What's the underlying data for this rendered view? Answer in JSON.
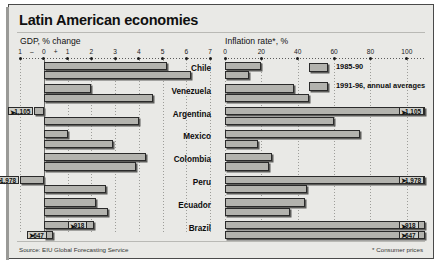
{
  "title": "Latin American economies",
  "source": "Source: EIU Global Forecasting Service",
  "footnote": "* Consumer prices",
  "legend": [
    {
      "label": "1985-90"
    },
    {
      "label": "1991-96, annual averages"
    }
  ],
  "panels": {
    "gdp": {
      "axis_title": "GDP, % change",
      "ticks": [
        "1",
        "–",
        "0",
        "+",
        "1",
        "2",
        "3",
        "4",
        "5",
        "6",
        "7"
      ]
    },
    "inflation": {
      "axis_title": "Inflation rate*, %",
      "ticks": [
        "0",
        "20",
        "40",
        "60",
        "80",
        "100"
      ]
    }
  },
  "chart_data": {
    "type": "bar",
    "title": "Latin American economies",
    "orientation": "horizontal",
    "categories": [
      "Chile",
      "Venezuela",
      "Argentina",
      "Mexico",
      "Colombia",
      "Peru",
      "Ecuador",
      "Brazil"
    ],
    "series_names": [
      "1985-90",
      "1991-96, annual averages"
    ],
    "panels": [
      {
        "name": "gdp",
        "xlabel": "GDP, % change",
        "xlim": [
          -1,
          7
        ],
        "ticks": [
          -1,
          0,
          1,
          2,
          3,
          4,
          5,
          6,
          7
        ],
        "ticklabels": [
          "1",
          "0",
          "1",
          "2",
          "3",
          "4",
          "5",
          "6",
          "7"
        ],
        "series": [
          {
            "name": "1985-90",
            "values": [
              5.2,
              2.0,
              -0.4,
              1.0,
              4.3,
              -1.0,
              2.2,
              2.1
            ]
          },
          {
            "name": "1991-96, annual averages",
            "values": [
              6.2,
              4.6,
              4.0,
              2.9,
              3.9,
              2.6,
              2.7,
              0.4
            ]
          }
        ]
      },
      {
        "name": "inflation",
        "xlabel": "Inflation rate*, %",
        "xlim": [
          0,
          110
        ],
        "ticks": [
          0,
          20,
          40,
          60,
          80,
          100
        ],
        "ticklabels": [
          "0",
          "20",
          "40",
          "60",
          "80",
          "100"
        ],
        "series": [
          {
            "name": "1985-90",
            "values": [
              20,
              38,
              1105,
              74,
              26,
              1978,
              44,
              918
            ]
          },
          {
            "name": "1991-96, annual averages",
            "values": [
              13,
              46,
              60,
              18,
              24,
              45,
              36,
              647
            ]
          }
        ]
      }
    ],
    "data_labels": [
      {
        "country": "Argentina",
        "series": "1985-90",
        "value": "1,105"
      },
      {
        "country": "Peru",
        "series": "1985-90",
        "value": "1,978"
      },
      {
        "country": "Brazil",
        "series": "1985-90",
        "value": "918"
      },
      {
        "country": "Brazil",
        "series": "1991-96, annual averages",
        "value": "647"
      }
    ],
    "grid": true,
    "legend_position": "top-right-of-inflation-panel"
  }
}
